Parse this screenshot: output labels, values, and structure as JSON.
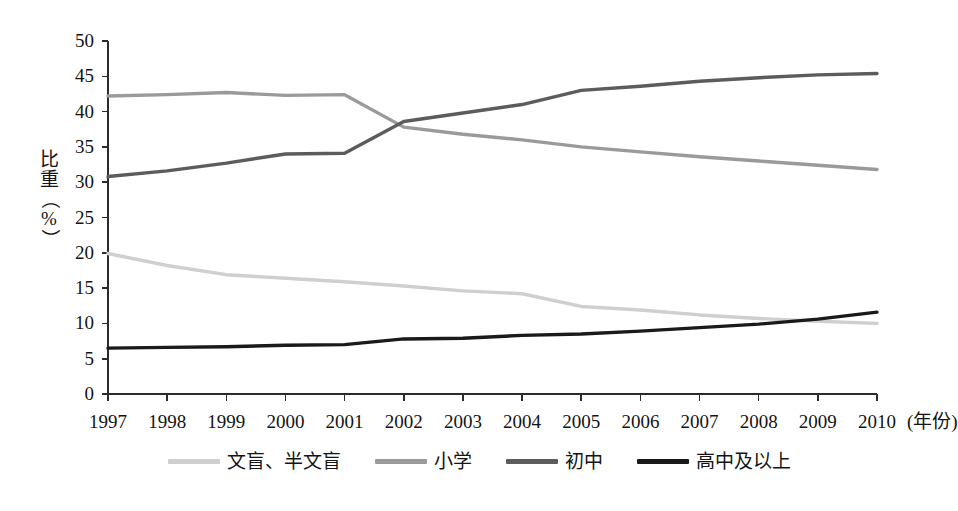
{
  "chart_data": {
    "type": "line",
    "title": "",
    "xlabel": "年份",
    "ylabel": "比重（%）",
    "x_unit_note": "(年份)",
    "categories": [
      "1997",
      "1998",
      "1999",
      "2000",
      "2001",
      "2002",
      "2003",
      "2004",
      "2005",
      "2006",
      "2007",
      "2008",
      "2009",
      "2010"
    ],
    "xlim": [
      1997,
      2010
    ],
    "ylim": [
      0,
      50
    ],
    "ytick_labels": [
      "50",
      "45",
      "40",
      "35",
      "30",
      "25",
      "20",
      "15",
      "10",
      "5",
      "0"
    ],
    "yticks": [
      50,
      45,
      40,
      35,
      30,
      25,
      20,
      15,
      10,
      5,
      0
    ],
    "grid": false,
    "legend_position": "bottom-center",
    "series": [
      {
        "name": "文盲、半文盲",
        "color": "#cfcfcf",
        "values": [
          19.9,
          18.2,
          16.9,
          16.4,
          15.9,
          15.3,
          14.6,
          14.2,
          12.4,
          11.9,
          11.2,
          10.7,
          10.3,
          10.0
        ]
      },
      {
        "name": "小学",
        "color": "#9a9a9a",
        "values": [
          42.2,
          42.4,
          42.7,
          42.3,
          42.4,
          37.8,
          36.8,
          36.0,
          35.0,
          34.3,
          33.6,
          33.0,
          32.4,
          31.8
        ]
      },
      {
        "name": "初中",
        "color": "#5c5c5c",
        "values": [
          30.8,
          31.6,
          32.7,
          34.0,
          34.1,
          38.6,
          39.8,
          41.0,
          43.0,
          43.6,
          44.3,
          44.8,
          45.2,
          45.4
        ]
      },
      {
        "name": "高中及以上",
        "color": "#1a1a1a",
        "values": [
          6.5,
          6.6,
          6.7,
          6.9,
          7.0,
          7.8,
          7.9,
          8.3,
          8.5,
          8.9,
          9.4,
          9.9,
          10.6,
          11.6
        ]
      }
    ]
  },
  "axis": {
    "y_title_chars": [
      "比",
      "重",
      "（",
      "%",
      "）"
    ],
    "x_unit": "(年份)"
  },
  "legend": {
    "items": [
      {
        "label": "文盲、半文盲",
        "color": "#cfcfcf"
      },
      {
        "label": "小学",
        "color": "#9a9a9a"
      },
      {
        "label": "初中",
        "color": "#5c5c5c"
      },
      {
        "label": "高中及以上",
        "color": "#1a1a1a"
      }
    ]
  },
  "style": {
    "axis_color": "#2b2b2b",
    "text_color": "#141414",
    "background": "#ffffff"
  }
}
